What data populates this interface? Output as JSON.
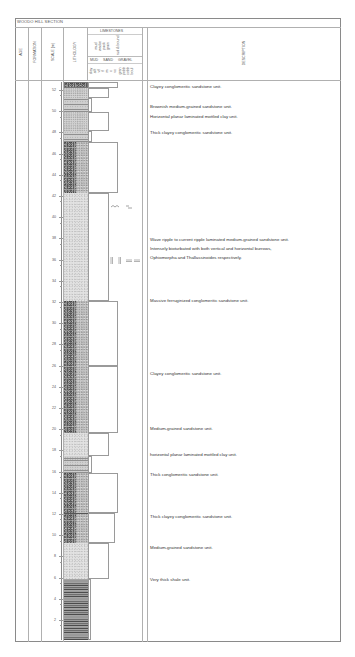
{
  "title": "WOODO HILL SECTION",
  "header": {
    "age": "AGE",
    "formation": "FORMATION",
    "scale": "SCALE (m)",
    "lithology": "LITHOLOGY",
    "limestones": "LIMESTONES",
    "limestone_types": [
      "mud",
      "wacke",
      "pack",
      "grain",
      "rud & bound"
    ],
    "grain_groups": [
      "MUD",
      "SAND",
      "GRAVEL"
    ],
    "grain_sizes": [
      "clay",
      "silt",
      "vf",
      "f",
      "m",
      "c",
      "vc",
      "gran",
      "pebb",
      "cobb",
      "boul"
    ],
    "description": "DESCRIPTION"
  },
  "scale": {
    "unit": "m",
    "ticks": [
      52,
      50,
      48,
      46,
      44,
      42,
      40,
      38,
      36,
      34,
      32,
      30,
      28,
      26,
      24,
      22,
      20,
      18,
      16,
      14,
      12,
      10,
      8,
      6,
      4,
      2
    ]
  },
  "units": [
    {
      "top": 53.0,
      "base": 52.4,
      "lithology": "conglomerate",
      "grain_width": 0.95,
      "description": "Clayey conglomeritic sandstone unit."
    },
    {
      "top": 52.4,
      "base": 51.5,
      "lithology": "sandstone",
      "grain_width": 0.72,
      "description": "Brownish medium-grained sandstone unit."
    },
    {
      "top": 51.5,
      "base": 50.2,
      "lithology": "clay",
      "grain_width": 0.3,
      "description": "Horizontal planar laminated mottled clay unit."
    },
    {
      "top": 50.2,
      "base": 48.4,
      "lithology": "sandstone",
      "grain_width": 0.72,
      "description": ""
    },
    {
      "top": 48.4,
      "base": 47.4,
      "lithology": "clay",
      "grain_width": 0.3,
      "description": "Thick clayey conglomeritic sandstone unit."
    },
    {
      "top": 47.4,
      "base": 42.6,
      "lithology": "conglomerate",
      "grain_width": 0.97,
      "description": ""
    },
    {
      "top": 42.6,
      "base": 32.4,
      "lithology": "sandstone-fine",
      "grain_width": 0.72,
      "description": "Wave ripple to current ripple laminated medium-grained sandstone unit. Intensely bioturbated with both vertical and horizontal burrows, Ophiomorpha and Thallassinoides respectively."
    },
    {
      "top": 32.4,
      "base": 26.2,
      "lithology": "conglomerate",
      "grain_width": 0.97,
      "description": "Massive ferruginized conglomeritic sandstone unit."
    },
    {
      "top": 26.2,
      "base": 19.8,
      "lithology": "conglomerate",
      "grain_width": 0.97,
      "description": "Clayey conglomeritic sandstone unit."
    },
    {
      "top": 19.8,
      "base": 17.6,
      "lithology": "sandstone-fine",
      "grain_width": 0.72,
      "description": "Medium-grained sandstone unit."
    },
    {
      "top": 17.6,
      "base": 16.0,
      "lithology": "clay",
      "grain_width": 0.3,
      "description": "horizontal planar laminated mottled clay unit."
    },
    {
      "top": 16.0,
      "base": 12.2,
      "lithology": "conglomerate",
      "grain_width": 0.97,
      "description": "Thick conglomeritic sandstone unit."
    },
    {
      "top": 12.2,
      "base": 9.4,
      "lithology": "conglomerate",
      "grain_width": 0.9,
      "description": "Thick clayey conglomeritic sandstone unit."
    },
    {
      "top": 9.4,
      "base": 6.0,
      "lithology": "sandstone-fine",
      "grain_width": 0.72,
      "description": "Medium-grained sandstone unit."
    },
    {
      "top": 6.0,
      "base": 0.2,
      "lithology": "shale",
      "grain_width": 0.16,
      "description": "Very thick shale unit."
    }
  ],
  "descriptions": {
    "d1": "Clayey conglomeritic sandstone unit.",
    "d2": "Brownish medium-grained sandstone unit.",
    "d3": "Horizontal planar laminated mottled clay unit.",
    "d4": "Thick clayey conglomeritic sandstone unit.",
    "d5a": "Wave ripple to current ripple laminated medium-grained sandstone unit.",
    "d5b": "Intensely bioturbated with both vertical and horizontal burrows,",
    "d5c": "Ophiomorpha and Thallassinoides respectively.",
    "d6": "Massive ferruginized conglomeritic sandstone unit.",
    "d7": "Clayey conglomeritic sandstone unit.",
    "d8": "Medium-grained sandstone unit.",
    "d9": "horizontal planar laminated mottled clay unit.",
    "d10": "Thick conglomeritic sandstone unit.",
    "d11": "Thick clayey conglomeritic sandstone unit.",
    "d12": "Medium-grained sandstone unit.",
    "d13": "Very thick shale unit."
  },
  "annotations": {
    "ripple_symbols": "~^~  ~-",
    "burrow_symbols": "|| || ==="
  }
}
